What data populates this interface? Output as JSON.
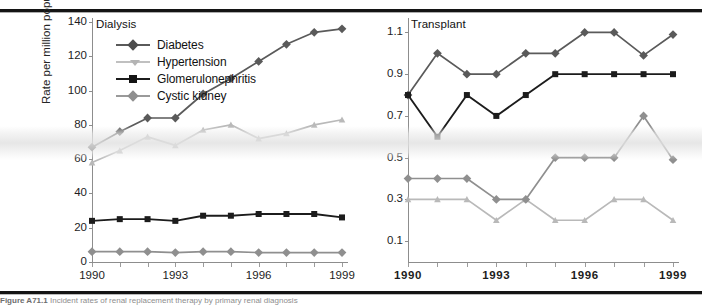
{
  "figure": {
    "caption_label": "Figure A71.1",
    "caption_text": "Incident rates of renal replacement therapy by primary renal diagnosis"
  },
  "legend": {
    "items": [
      {
        "label": "Diabetes",
        "color": "#5a5a5a",
        "marker": "diamond",
        "key": "diabetes"
      },
      {
        "label": "Hypertension",
        "color": "#b9b9b9",
        "marker": "triangle",
        "key": "hypertension"
      },
      {
        "label": "Glomerulonephritis",
        "color": "#1c1c1c",
        "marker": "square",
        "key": "glomerulonephritis"
      },
      {
        "label": "Cystic kidney",
        "color": "#8f8f8f",
        "marker": "diamond",
        "key": "cystic_kidney"
      }
    ]
  },
  "panels": {
    "dialysis": {
      "title": "Dialysis",
      "ylabel": "Rate per million population",
      "yticks": [
        "0",
        "20",
        "40",
        "60",
        "80",
        "100",
        "120",
        "140"
      ],
      "xticks": [
        "1990",
        "1993",
        "1996",
        "1999"
      ]
    },
    "transplant": {
      "title": "Transplant",
      "yticks": [
        "0.1",
        "0.3",
        "0.5",
        "0.7",
        "0.9",
        "1.1"
      ],
      "xticks": [
        "1990",
        "1993",
        "1996",
        "1999"
      ]
    }
  },
  "chart_data": [
    {
      "type": "line",
      "title": "Dialysis",
      "xlabel": "",
      "ylabel": "Rate per million population",
      "x": [
        1990,
        1991,
        1992,
        1993,
        1994,
        1995,
        1996,
        1997,
        1998,
        1999
      ],
      "xtick_labels": [
        "1990",
        "1993",
        "1996",
        "1999"
      ],
      "ylim": [
        0,
        140
      ],
      "yticks": [
        0,
        20,
        40,
        60,
        80,
        100,
        120,
        140
      ],
      "grid": false,
      "legend_position": "upper-left",
      "series": [
        {
          "name": "Diabetes",
          "color": "#5a5a5a",
          "marker": "diamond",
          "values": [
            67,
            76,
            84,
            84,
            98,
            107,
            117,
            127,
            134,
            136
          ]
        },
        {
          "name": "Hypertension",
          "color": "#b9b9b9",
          "marker": "triangle",
          "values": [
            58,
            65,
            73,
            68,
            77,
            80,
            72,
            75,
            80,
            83
          ]
        },
        {
          "name": "Glomerulonephritis",
          "color": "#1c1c1c",
          "marker": "square",
          "values": [
            24,
            25,
            25,
            24,
            27,
            27,
            28,
            28,
            28,
            26
          ]
        },
        {
          "name": "Cystic kidney",
          "color": "#8f8f8f",
          "marker": "diamond",
          "values": [
            6,
            6,
            6,
            5.5,
            6,
            6,
            5.5,
            5.5,
            5.5,
            5.5
          ]
        }
      ]
    },
    {
      "type": "line",
      "title": "Transplant",
      "xlabel": "",
      "ylabel": "",
      "x": [
        1990,
        1991,
        1992,
        1993,
        1994,
        1995,
        1996,
        1997,
        1998,
        1999
      ],
      "xtick_labels": [
        "1990",
        "1993",
        "1996",
        "1999"
      ],
      "ylim": [
        0.0,
        1.15
      ],
      "yticks": [
        0.1,
        0.3,
        0.5,
        0.7,
        0.9,
        1.1
      ],
      "grid": false,
      "legend_position": "none",
      "series": [
        {
          "name": "Diabetes",
          "color": "#5a5a5a",
          "marker": "diamond",
          "values": [
            0.8,
            1.0,
            0.9,
            0.9,
            1.0,
            1.0,
            1.1,
            1.1,
            0.99,
            1.09
          ]
        },
        {
          "name": "Hypertension",
          "color": "#b9b9b9",
          "marker": "triangle",
          "values": [
            0.3,
            0.3,
            0.3,
            0.2,
            0.3,
            0.2,
            0.2,
            0.3,
            0.3,
            0.2
          ]
        },
        {
          "name": "Glomerulonephritis",
          "color": "#1c1c1c",
          "marker": "square",
          "values": [
            0.8,
            0.6,
            0.8,
            0.7,
            0.8,
            0.9,
            0.9,
            0.9,
            0.9,
            0.9
          ]
        },
        {
          "name": "Cystic kidney",
          "color": "#8f8f8f",
          "marker": "diamond",
          "values": [
            0.4,
            0.4,
            0.4,
            0.3,
            0.3,
            0.5,
            0.5,
            0.5,
            0.7,
            0.49
          ]
        }
      ]
    }
  ]
}
